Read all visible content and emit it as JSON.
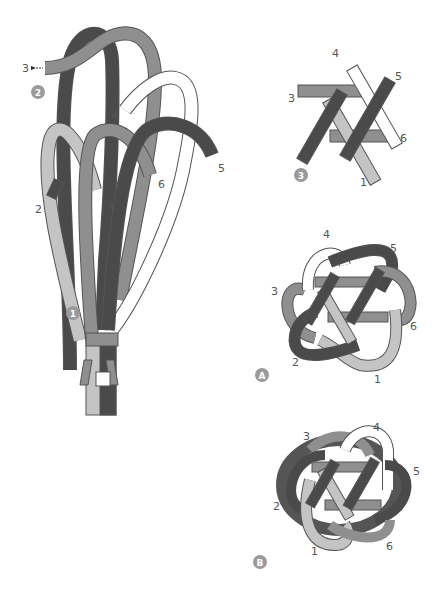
{
  "colors": {
    "dark": "#4a4a4a",
    "mid": "#8f8f8f",
    "light": "#c4c4c4",
    "white": "#ffffff",
    "outline": "#555555",
    "badge": "#9a9a9a"
  },
  "steps": [
    {
      "badge": "1",
      "description": "strands gathered and bound at base"
    },
    {
      "badge": "2",
      "description": "strands looped upward"
    },
    {
      "badge": "3",
      "description": "central hexagram weave"
    },
    {
      "badge": "A",
      "description": "loops tucked, front view"
    },
    {
      "badge": "B",
      "description": "finished knot"
    }
  ],
  "panel_2_labels": [
    "3",
    "4",
    "5",
    "6",
    "2",
    "3"
  ],
  "panel_3_labels": [
    "4",
    "5",
    "3",
    "6",
    "2",
    "1"
  ],
  "panel_A_labels": [
    "4",
    "5",
    "3",
    "6",
    "2",
    "1"
  ],
  "panel_B_labels": [
    "3",
    "4",
    "5",
    "2",
    "6",
    "1"
  ]
}
